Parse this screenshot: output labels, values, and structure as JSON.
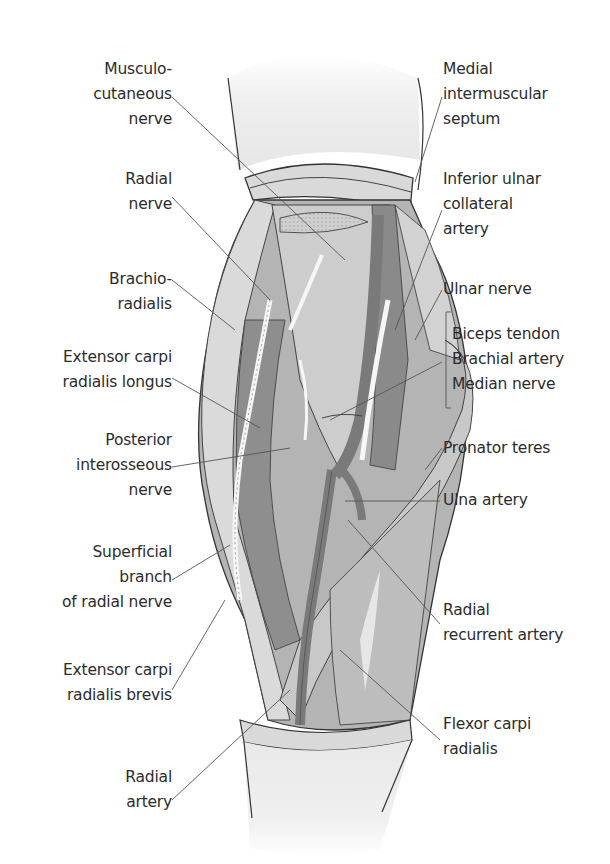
{
  "figure": {
    "colors": {
      "background": "#ffffff",
      "skin": "#eeeeee",
      "muscle_dark": "#8f8f8f",
      "muscle_mid": "#b0b0b0",
      "muscle_light": "#d6d6d6",
      "artery": "#7c7c7c",
      "nerve": "#f4f4f4",
      "outline": "#3a3a3a",
      "leader": "#555555",
      "text": "#2c2c2c"
    }
  },
  "labels_left": [
    {
      "id": "musculocutaneous-nerve",
      "lines": [
        "Musculo-",
        "cutaneous",
        "nerve"
      ]
    },
    {
      "id": "radial-nerve",
      "lines": [
        "Radial",
        "nerve"
      ]
    },
    {
      "id": "brachioradialis",
      "lines": [
        "Brachio-",
        "radialis"
      ]
    },
    {
      "id": "extensor-carpi-radialis-longus",
      "lines": [
        "Extensor carpi",
        "radialis longus"
      ]
    },
    {
      "id": "posterior-interosseous-nerve",
      "lines": [
        "Posterior",
        "interosseous",
        "nerve"
      ]
    },
    {
      "id": "superficial-branch-radial-nerve",
      "lines": [
        "Superficial",
        "branch",
        "of radial nerve"
      ]
    },
    {
      "id": "extensor-carpi-radialis-brevis",
      "lines": [
        "Extensor carpi",
        "radialis brevis"
      ]
    },
    {
      "id": "radial-artery",
      "lines": [
        "Radial",
        "artery"
      ]
    }
  ],
  "labels_right": [
    {
      "id": "medial-intermuscular-septum",
      "lines": [
        "Medial",
        "intermuscular",
        "septum"
      ]
    },
    {
      "id": "inferior-ulnar-collateral-artery",
      "lines": [
        "Inferior ulnar",
        "collateral",
        "artery"
      ]
    },
    {
      "id": "ulnar-nerve",
      "lines": [
        "Ulnar nerve"
      ]
    },
    {
      "id": "biceps-group",
      "lines": [
        "Biceps tendon",
        "Brachial artery",
        "Median nerve"
      ]
    },
    {
      "id": "pronator-teres",
      "lines": [
        "Pronator teres"
      ]
    },
    {
      "id": "ulna-artery",
      "lines": [
        "Ulna artery"
      ]
    },
    {
      "id": "radial-recurrent-artery",
      "lines": [
        "Radial",
        "recurrent artery"
      ]
    },
    {
      "id": "flexor-carpi-radialis",
      "lines": [
        "Flexor carpi",
        "radialis"
      ]
    }
  ]
}
